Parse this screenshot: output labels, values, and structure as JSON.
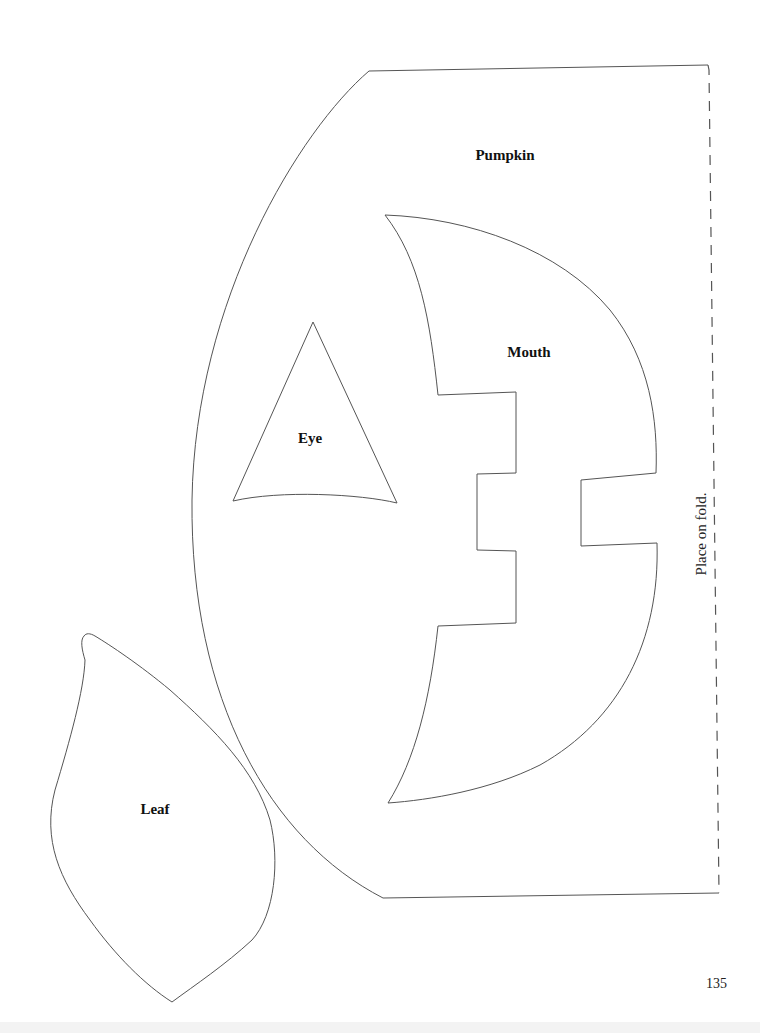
{
  "page": {
    "number": "135",
    "line_color": "#555555"
  },
  "pieces": {
    "pumpkin": {
      "label": "Pumpkin"
    },
    "mouth": {
      "label": "Mouth"
    },
    "eye": {
      "label": "Eye"
    },
    "leaf": {
      "label": "Leaf"
    }
  },
  "fold": {
    "instruction": "Place on fold."
  }
}
